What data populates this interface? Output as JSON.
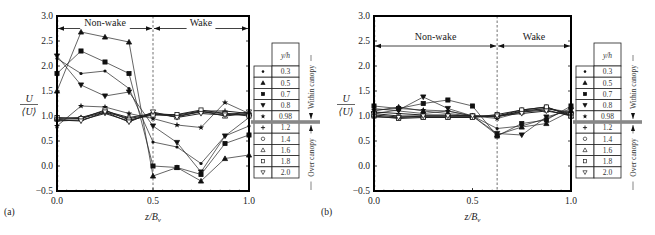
{
  "chart_data": [
    {
      "type": "line",
      "panel_label": "(a)",
      "xlabel": "z/B_v",
      "ylabel": "U/⟨U⟩",
      "xlim": [
        0,
        1
      ],
      "ylim": [
        -0.5,
        3.0
      ],
      "xticks": [
        "0.0",
        "0.5",
        "1.0"
      ],
      "yticks": [
        "-0.5",
        "0.0",
        "0.5",
        "1.0",
        "1.5",
        "2.0",
        "2.5",
        "3.0"
      ],
      "divider_x": 0.5,
      "annotations": [
        {
          "text": "Non-wake",
          "from": 0,
          "to": 0.5
        },
        {
          "text": "Wake",
          "from": 0.5,
          "to": 1.0
        }
      ],
      "x": [
        0,
        0.125,
        0.25,
        0.375,
        0.5,
        0.625,
        0.75,
        0.875,
        1.0
      ],
      "series": [
        {
          "name": "0.3",
          "marker": "dot",
          "values": [
            2.15,
            1.85,
            1.9,
            1.55,
            0.48,
            0.38,
            0.05,
            0.6,
            0.8
          ]
        },
        {
          "name": "0.5",
          "marker": "triangle-up",
          "values": [
            1.5,
            2.68,
            2.58,
            2.48,
            -0.2,
            -0.03,
            -0.3,
            0.15,
            0.22
          ]
        },
        {
          "name": "0.7",
          "marker": "square",
          "values": [
            1.85,
            2.3,
            2.08,
            1.85,
            0.0,
            -0.03,
            -0.17,
            0.45,
            0.62
          ]
        },
        {
          "name": "0.8",
          "marker": "triangle-down",
          "values": [
            2.2,
            1.62,
            1.4,
            1.48,
            0.8,
            0.47,
            -0.12,
            0.6,
            0.97
          ]
        },
        {
          "name": "0.98",
          "marker": "star",
          "values": [
            0.8,
            1.2,
            1.18,
            1.05,
            0.95,
            0.82,
            0.77,
            1.27,
            1.05
          ]
        },
        {
          "name": "1.2",
          "marker": "plus",
          "values": [
            0.9,
            0.92,
            1.05,
            0.9,
            1.05,
            1.02,
            1.1,
            1.1,
            1.05
          ]
        },
        {
          "name": "1.4",
          "marker": "circle-open",
          "values": [
            0.93,
            0.95,
            1.08,
            0.95,
            1.03,
            1.0,
            1.08,
            1.05,
            1.03
          ]
        },
        {
          "name": "1.6",
          "marker": "triangle-up-open",
          "values": [
            0.95,
            0.97,
            1.1,
            0.97,
            1.05,
            0.98,
            1.1,
            1.0,
            1.05
          ]
        },
        {
          "name": "1.8",
          "marker": "square-open",
          "values": [
            0.97,
            0.95,
            1.12,
            0.92,
            1.02,
            1.03,
            1.12,
            1.05,
            1.0
          ]
        },
        {
          "name": "2.0",
          "marker": "triangle-down-open",
          "values": [
            0.92,
            0.9,
            1.08,
            0.88,
            1.08,
            0.97,
            1.05,
            1.02,
            1.08
          ]
        }
      ]
    },
    {
      "type": "line",
      "panel_label": "(b)",
      "xlabel": "z/B_v",
      "ylabel": "U/⟨U⟩",
      "xlim": [
        0,
        1
      ],
      "ylim": [
        -0.5,
        3.0
      ],
      "xticks": [
        "0.0",
        "0.5",
        "1.0"
      ],
      "yticks": [
        "-0.5",
        "0.0",
        "0.5",
        "1.0",
        "1.5",
        "2.0",
        "2.5",
        "3.0"
      ],
      "divider_x": 0.625,
      "annotations": [
        {
          "text": "Non-wake",
          "from": 0,
          "to": 0.625
        },
        {
          "text": "Wake",
          "from": 0.625,
          "to": 1.0
        }
      ],
      "x": [
        0,
        0.125,
        0.25,
        0.375,
        0.5,
        0.625,
        0.75,
        0.875,
        1.0
      ],
      "series": [
        {
          "name": "0.3",
          "marker": "dot",
          "values": [
            1.15,
            1.1,
            1.05,
            1.1,
            1.0,
            0.75,
            0.8,
            0.95,
            1.15
          ]
        },
        {
          "name": "0.5",
          "marker": "triangle-up",
          "values": [
            1.1,
            1.18,
            1.1,
            1.05,
            1.0,
            0.62,
            0.78,
            0.85,
            1.1
          ]
        },
        {
          "name": "0.7",
          "marker": "square",
          "values": [
            1.2,
            1.15,
            1.25,
            1.32,
            1.2,
            0.6,
            0.85,
            0.92,
            1.2
          ]
        },
        {
          "name": "0.8",
          "marker": "triangle-down",
          "values": [
            1.05,
            1.12,
            1.38,
            1.15,
            1.0,
            0.65,
            0.62,
            0.98,
            1.12
          ]
        },
        {
          "name": "0.98",
          "marker": "star",
          "values": [
            1.12,
            1.15,
            1.12,
            1.1,
            1.0,
            0.95,
            1.08,
            1.15,
            1.08
          ]
        },
        {
          "name": "1.2",
          "marker": "plus",
          "values": [
            1.08,
            1.05,
            1.02,
            1.02,
            1.0,
            0.98,
            1.1,
            1.15,
            1.05
          ]
        },
        {
          "name": "1.4",
          "marker": "circle-open",
          "values": [
            1.05,
            1.0,
            1.0,
            1.0,
            1.0,
            1.0,
            1.12,
            1.18,
            1.02
          ]
        },
        {
          "name": "1.6",
          "marker": "triangle-up-open",
          "values": [
            1.02,
            0.98,
            0.98,
            0.98,
            0.98,
            1.0,
            1.08,
            1.12,
            1.0
          ]
        },
        {
          "name": "1.8",
          "marker": "square-open",
          "values": [
            1.0,
            0.95,
            0.97,
            0.97,
            0.97,
            1.03,
            1.12,
            1.18,
            1.0
          ]
        },
        {
          "name": "2.0",
          "marker": "triangle-down-open",
          "values": [
            0.98,
            0.97,
            1.0,
            1.0,
            1.0,
            1.0,
            1.05,
            1.1,
            1.02
          ]
        }
      ]
    }
  ],
  "legend": {
    "header": "y/h",
    "within_canopy": "Within canopy",
    "over_canopy": "Over canopy"
  }
}
